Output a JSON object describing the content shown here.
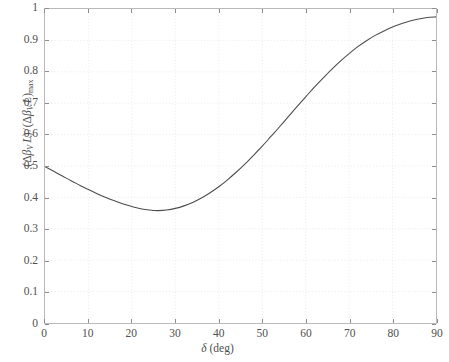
{
  "chart_data": {
    "type": "line",
    "title": "",
    "subtitle": "",
    "xlabel_text": "δ (deg)",
    "xlabel_symbol": "δ",
    "xlabel_unit": "(deg)",
    "ylabel_text": "(Δβ_V L)/(Δβ_V L)_max",
    "ylabel_parts": {
      "num_open": "(",
      "num_delta": "Δ",
      "num_beta": "β",
      "num_beta_sub": "V",
      "num_L": "L",
      "num_close": ")",
      "slash": "/",
      "den_open": "(",
      "den_delta": "Δ",
      "den_beta": "β",
      "den_beta_sub": "V",
      "den_L": "L",
      "den_close": ")",
      "den_sub": "max"
    },
    "xlim": [
      0,
      90
    ],
    "ylim": [
      0,
      1
    ],
    "xticks": [
      0,
      10,
      20,
      30,
      40,
      50,
      60,
      70,
      80,
      90
    ],
    "xtick_labels": [
      "0",
      "10",
      "20",
      "30",
      "40",
      "50",
      "60",
      "70",
      "80",
      "90"
    ],
    "yticks": [
      0,
      0.1,
      0.2,
      0.3,
      0.4,
      0.5,
      0.6,
      0.7,
      0.8,
      0.9,
      1
    ],
    "ytick_labels": [
      "0",
      "0.1",
      "0.2",
      "0.3",
      "0.4",
      "0.5",
      "0.6",
      "0.7",
      "0.8",
      "0.9",
      "1"
    ],
    "grid": true,
    "grid_style": "dotted",
    "grid_color": "#e8e8e8",
    "legend": null,
    "legend_position": "none",
    "line_color": "#4d4d4d",
    "line_width": 1.1,
    "background_color": "#ffffff",
    "frame_color": "#b9b9b9",
    "series": [
      {
        "name": "normalized walk-off length product",
        "x": [
          0,
          2,
          4,
          6,
          8,
          10,
          12,
          14,
          16,
          18,
          20,
          22,
          24,
          25,
          26,
          28,
          30,
          32,
          34,
          36,
          38,
          40,
          42,
          44,
          46,
          48,
          50,
          52,
          54,
          56,
          58,
          60,
          62,
          64,
          66,
          68,
          70,
          72,
          74,
          76,
          78,
          80,
          82,
          84,
          86,
          88,
          90
        ],
        "y": [
          0.498,
          0.483,
          0.468,
          0.453,
          0.439,
          0.425,
          0.412,
          0.4,
          0.389,
          0.379,
          0.371,
          0.364,
          0.36,
          0.3585,
          0.358,
          0.36,
          0.365,
          0.373,
          0.384,
          0.398,
          0.415,
          0.434,
          0.456,
          0.48,
          0.506,
          0.534,
          0.563,
          0.594,
          0.625,
          0.657,
          0.689,
          0.72,
          0.751,
          0.78,
          0.808,
          0.834,
          0.858,
          0.88,
          0.899,
          0.916,
          0.93,
          0.943,
          0.953,
          0.962,
          0.968,
          0.973,
          0.975
        ]
      }
    ],
    "annotations": {
      "min_value": 0.358,
      "min_at_x": 25,
      "start_value": 0.498,
      "end_value": 0.975
    }
  }
}
